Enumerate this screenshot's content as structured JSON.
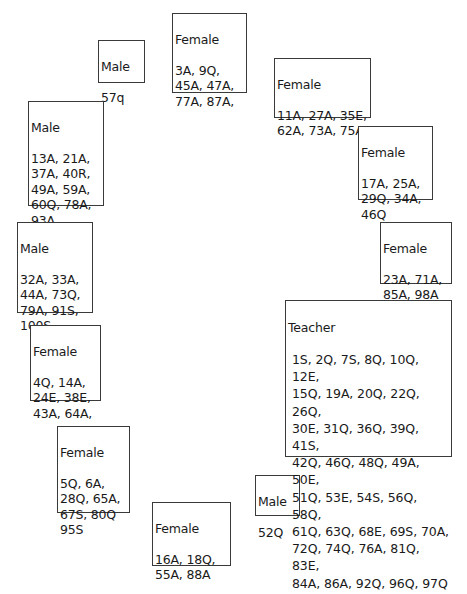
{
  "groups": [
    {
      "id": "male-57",
      "title": "Male",
      "codes": "57q"
    },
    {
      "id": "female-3",
      "title": "Female",
      "codes": "3A, 9Q,\n45A, 47A,\n77A, 87A,"
    },
    {
      "id": "female-11",
      "title": "Female",
      "codes": "11A, 27A, 35E,\n62A, 73A, 75A"
    },
    {
      "id": "female-17",
      "title": "Female",
      "codes": "17A, 25A,\n29Q, 34A,\n46Q"
    },
    {
      "id": "female-23",
      "title": "Female",
      "codes": "23A, 71A,\n85A, 98A"
    },
    {
      "id": "male-13",
      "title": "Male",
      "codes": "13A, 21A,\n37A, 40R,\n49A, 59A,\n60Q, 78A,\n93A"
    },
    {
      "id": "male-32",
      "title": "Male",
      "codes": "32A, 33A,\n44A, 73Q,\n79A, 91S,\n100S"
    },
    {
      "id": "female-4",
      "title": "Female",
      "codes": "4Q, 14A,\n24E, 38E,\n43A, 64A,"
    },
    {
      "id": "female-5",
      "title": "Female",
      "codes": "5Q, 6A,\n28Q, 65A,\n67S, 80Q\n95S"
    },
    {
      "id": "female-16",
      "title": "Female",
      "codes": "16A, 18Q,\n55A, 88A"
    },
    {
      "id": "male-52",
      "title": "Male",
      "codes": "52Q"
    },
    {
      "id": "teacher",
      "title": "Teacher",
      "codes": "1S, 2Q, 7S, 8Q, 10Q, 12E,\n15Q, 19A, 20Q, 22Q, 26Q,\n30E, 31Q, 36Q, 39Q, 41S,\n42Q, 46Q, 48Q, 49A, 50E,\n51Q, 53E, 54S, 56Q, 58Q,\n61Q, 63Q, 68E, 69S, 70A,\n72Q, 74Q, 76A, 81Q, 83E,\n84A, 86A, 92Q, 96Q, 97Q"
    }
  ]
}
